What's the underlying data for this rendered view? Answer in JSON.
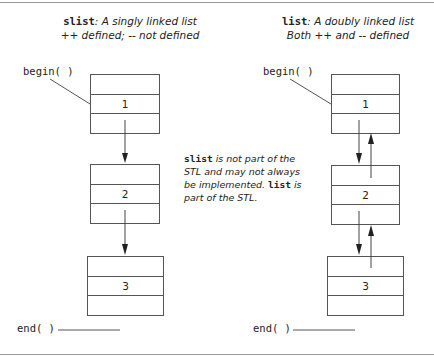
{
  "left_panel": {
    "title_code": "slist",
    "title_line1_rest": ": A singly linked list",
    "title_line2": "++ defined; -- not defined",
    "begin_label": "begin( )",
    "end_label": "end( )",
    "nodes": [
      {
        "value": "1"
      },
      {
        "value": "2"
      },
      {
        "value": "3"
      }
    ]
  },
  "right_panel": {
    "title_code": "list",
    "title_line1_rest": ": A doubly linked list",
    "title_line2": "Both ++ and -- defined",
    "begin_label": "begin( )",
    "end_label": "end( )",
    "nodes": [
      {
        "value": "1"
      },
      {
        "value": "2"
      },
      {
        "value": "3"
      }
    ]
  },
  "note": {
    "code1": "slist",
    "text1": " is not part of the STL and may not always be implemented. ",
    "code2": "list",
    "text2": " is part of the STL."
  },
  "colors": {
    "line": "#555555",
    "rule": "#9a9a9a",
    "text": "#222222"
  }
}
